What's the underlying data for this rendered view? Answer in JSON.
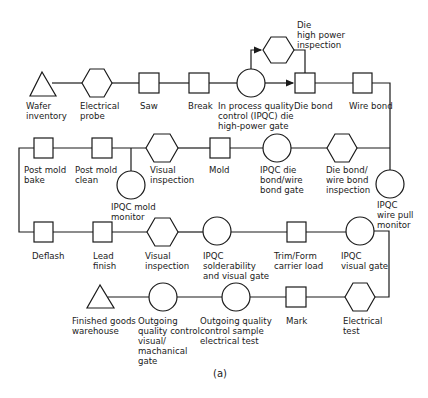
{
  "diagram": {
    "caption": "(a)",
    "row1": {
      "wafer_inventory": "Wafer\ninventory",
      "electrical_probe": "Electrical\nprobe",
      "saw": "Saw",
      "break": "Break",
      "ipqc_die_gate": "In process quality\ncontrol (IPQC) die\nhigh-power gate",
      "die_high_power": "Die\nhigh power\ninspection",
      "die_bond": "Die bond",
      "wire_bond": "Wire bond"
    },
    "row2": {
      "post_mold_bake": "Post mold\nbake",
      "post_mold_clean": "Post mold\nclean",
      "ipqc_mold_monitor": "IPQC mold\nmonitor",
      "visual_inspection": "Visual\ninspection",
      "mold": "Mold",
      "ipqc_die_wire_gate": "IPQC die\nbond/wire\nbond gate",
      "die_wire_inspection": "Die bond/\nwire bond\ninspection",
      "ipqc_wire_pull": "IPQC\nwire pull\nmonitor"
    },
    "row3": {
      "deflash": "Deflash",
      "lead_finish": "Lead\nfinish",
      "visual_inspection": "Visual\ninspection",
      "ipqc_solderability": "IPQC\nsolderability\nand visual gate",
      "trim_form": "Trim/Form\ncarrier load",
      "ipqc_visual_gate": "IPQC\nvisual gate"
    },
    "row4": {
      "finished_goods": "Finished goods\nwarehouse",
      "oqc_visual": "Outgoing\nquality control\nvisual/\nmachanical\ngate",
      "oqc_electrical": "Outgoing quality\ncontrol sample\nelectrical test",
      "mark": "Mark",
      "electrical_test": "Electrical\ntest"
    }
  }
}
